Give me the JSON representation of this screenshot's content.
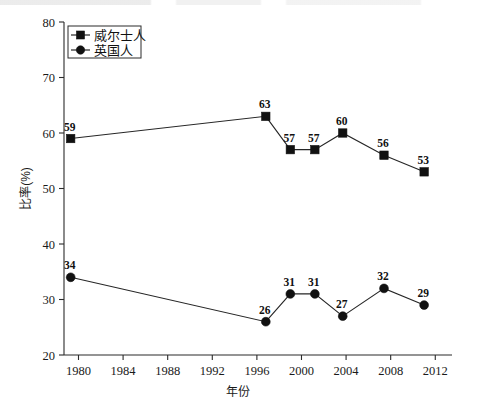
{
  "chart_data": {
    "type": "line",
    "title": "",
    "xlabel": "年份",
    "ylabel": "比率(%)",
    "xlim": [
      1978.7,
      2013.5
    ],
    "ylim": [
      20,
      80
    ],
    "xticks": [
      1980,
      1984,
      1988,
      1992,
      1996,
      2000,
      2004,
      2008,
      2012
    ],
    "yticks": [
      20,
      30,
      40,
      50,
      60,
      70,
      80
    ],
    "grid": false,
    "legend_position": "top-left",
    "x": [
      1979.3,
      1996.8,
      1999.0,
      2001.2,
      2003.7,
      2007.4,
      2011.0
    ],
    "series": [
      {
        "name": "威尔士人",
        "marker": "square",
        "values": [
          59,
          63,
          57,
          57,
          60,
          56,
          53
        ],
        "labels": [
          "59",
          "63",
          "57",
          "57",
          "60",
          "56",
          "53"
        ]
      },
      {
        "name": "英国人",
        "marker": "circle",
        "values": [
          34,
          26,
          31,
          31,
          27,
          32,
          29
        ],
        "labels": [
          "34",
          "26",
          "31",
          "31",
          "27",
          "32",
          "29"
        ]
      }
    ],
    "colors": {
      "line": "#262626",
      "marker": "#111111",
      "axis": "#2b2b2b",
      "background": "#ffffff"
    }
  },
  "legend": {
    "items": [
      {
        "label": "威尔士人",
        "marker": "square"
      },
      {
        "label": "英国人",
        "marker": "circle"
      }
    ]
  },
  "axis_labels": {
    "x": "年份",
    "y": "比率(%)",
    "xticks": [
      "1980",
      "1984",
      "1988",
      "1992",
      "1996",
      "2000",
      "2004",
      "2008",
      "2012"
    ],
    "yticks": [
      "20",
      "30",
      "40",
      "50",
      "60",
      "70",
      "80"
    ]
  }
}
